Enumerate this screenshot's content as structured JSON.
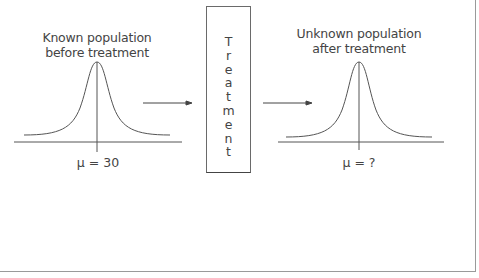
{
  "diagram": {
    "left": {
      "title_line1": "Known population",
      "title_line2": "before treatment",
      "mean_label": "μ = 30"
    },
    "treatment": {
      "letters": [
        "T",
        "r",
        "e",
        "a",
        "t",
        "m",
        "e",
        "n",
        "t"
      ],
      "word": "Treatment"
    },
    "right": {
      "title_line1": "Unknown population",
      "title_line2": "after treatment",
      "mean_label": "μ = ?"
    },
    "colors": {
      "line": "#555555",
      "text": "#444444",
      "frame": "#9a9a9a"
    }
  }
}
